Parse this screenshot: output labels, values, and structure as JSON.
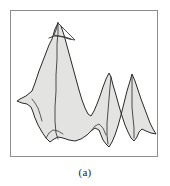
{
  "figure": {
    "caption": "(a)",
    "frame": {
      "x": 10,
      "y": 10,
      "width": 148,
      "height": 147,
      "border_color": "#8d8d8d",
      "background_color": "#ffffff"
    },
    "canvas": {
      "width": 170,
      "height": 186,
      "background_color": "#ffffff"
    }
  },
  "chart_data": {
    "type": "line",
    "title": "",
    "subtitle": "",
    "xlabel": "",
    "ylabel": "",
    "xlim": [
      0,
      148
    ],
    "ylim": [
      0,
      147
    ],
    "grid": false,
    "legend_position": "none",
    "annotations": [
      "(a)"
    ],
    "style": {
      "fill_color": "#e3e3e1",
      "stroke_color": "#2a2a2a",
      "ridge_color": "#3a3a3a",
      "stroke_width": 1.0,
      "ridge_width": 0.8
    },
    "peaks": [
      {
        "name": "main-peak",
        "apex_x": 48,
        "apex_y": 12,
        "height": 135
      },
      {
        "name": "middle-peak",
        "apex_x": 105,
        "apex_y": 63,
        "height": 84
      },
      {
        "name": "right-peak",
        "apex_x": 131,
        "apex_y": 72,
        "height": 75
      }
    ],
    "series": [
      {
        "name": "terrain-outline",
        "points": [
          [
            47,
            12
          ],
          [
            44,
            18
          ],
          [
            41,
            28
          ],
          [
            38,
            34
          ],
          [
            33,
            47
          ],
          [
            28,
            60
          ],
          [
            24,
            72
          ],
          [
            21,
            80
          ],
          [
            15,
            85
          ],
          [
            9,
            88
          ],
          [
            6,
            90
          ],
          [
            11,
            92
          ],
          [
            16,
            93
          ],
          [
            20,
            96
          ],
          [
            22,
            101
          ],
          [
            24,
            107
          ],
          [
            27,
            114
          ],
          [
            31,
            121
          ],
          [
            35,
            127
          ],
          [
            39,
            131
          ],
          [
            43,
            128
          ],
          [
            47,
            126
          ],
          [
            52,
            127
          ],
          [
            58,
            129
          ],
          [
            64,
            130
          ],
          [
            70,
            128
          ],
          [
            76,
            124
          ],
          [
            80,
            120
          ],
          [
            84,
            117
          ],
          [
            88,
            119
          ],
          [
            90,
            124
          ],
          [
            92,
            129
          ],
          [
            95,
            133
          ],
          [
            98,
            136
          ],
          [
            101,
            131
          ],
          [
            104,
            124
          ],
          [
            107,
            115
          ],
          [
            110,
            104
          ],
          [
            113,
            92
          ],
          [
            116,
            80
          ],
          [
            119,
            70
          ],
          [
            121,
            63
          ],
          [
            124,
            70
          ],
          [
            127,
            79
          ],
          [
            130,
            88
          ],
          [
            133,
            96
          ],
          [
            136,
            104
          ],
          [
            139,
            112
          ],
          [
            142,
            118
          ],
          [
            145,
            123
          ],
          [
            140,
            122
          ],
          [
            135,
            120
          ],
          [
            131,
            118
          ],
          [
            128,
            121
          ],
          [
            126,
            126
          ],
          [
            123,
            130
          ],
          [
            120,
            127
          ],
          [
            117,
            121
          ],
          [
            114,
            114
          ],
          [
            111,
            105
          ],
          [
            108,
            95
          ],
          [
            105,
            84
          ],
          [
            102,
            74
          ],
          [
            100,
            66
          ],
          [
            98,
            62
          ],
          [
            95,
            68
          ],
          [
            92,
            76
          ],
          [
            89,
            85
          ],
          [
            86,
            93
          ],
          [
            83,
            100
          ],
          [
            80,
            105
          ],
          [
            77,
            103
          ],
          [
            74,
            97
          ],
          [
            71,
            89
          ],
          [
            68,
            79
          ],
          [
            65,
            68
          ],
          [
            62,
            57
          ],
          [
            59,
            46
          ],
          [
            56,
            35
          ],
          [
            53,
            24
          ],
          [
            50,
            15
          ],
          [
            47,
            12
          ]
        ]
      },
      {
        "name": "main-ridge",
        "points": [
          [
            47,
            13
          ],
          [
            47,
            22
          ],
          [
            46,
            33
          ],
          [
            46,
            48
          ],
          [
            45,
            64
          ],
          [
            45,
            80
          ],
          [
            44,
            96
          ],
          [
            44,
            110
          ],
          [
            45,
            122
          ],
          [
            47,
            128
          ]
        ]
      },
      {
        "name": "summit-facet",
        "points": [
          [
            47,
            12
          ],
          [
            53,
            18
          ],
          [
            59,
            24
          ],
          [
            64,
            29
          ],
          [
            58,
            28
          ],
          [
            52,
            26
          ],
          [
            47,
            25
          ],
          [
            43,
            24
          ],
          [
            45,
            19
          ],
          [
            47,
            12
          ]
        ]
      },
      {
        "name": "summit-notch",
        "points": [
          [
            38,
            27
          ],
          [
            43,
            25
          ],
          [
            48,
            25
          ],
          [
            54,
            26
          ],
          [
            60,
            28
          ]
        ]
      },
      {
        "name": "middle-ridge",
        "points": [
          [
            100,
            66
          ],
          [
            99,
            76
          ],
          [
            98,
            88
          ],
          [
            97,
            100
          ],
          [
            96,
            112
          ],
          [
            96,
            124
          ],
          [
            97,
            133
          ]
        ]
      },
      {
        "name": "right-ridge",
        "points": [
          [
            121,
            64
          ],
          [
            121,
            74
          ],
          [
            121,
            85
          ],
          [
            121,
            96
          ],
          [
            122,
            107
          ],
          [
            123,
            117
          ],
          [
            123,
            127
          ]
        ]
      },
      {
        "name": "left-spur-crease",
        "points": [
          [
            21,
            88
          ],
          [
            24,
            92
          ],
          [
            27,
            97
          ],
          [
            29,
            103
          ],
          [
            31,
            110
          ]
        ]
      },
      {
        "name": "lower-left-crease",
        "points": [
          [
            35,
            127
          ],
          [
            38,
            122
          ],
          [
            42,
            119
          ],
          [
            47,
            120
          ],
          [
            52,
            123
          ]
        ]
      },
      {
        "name": "saddle-crease",
        "points": [
          [
            80,
            120
          ],
          [
            84,
            115
          ],
          [
            88,
            113
          ],
          [
            92,
            117
          ],
          [
            95,
            124
          ]
        ]
      }
    ]
  }
}
